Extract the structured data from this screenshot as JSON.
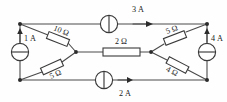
{
  "figure": {
    "name": "electrical-circuit-schematic",
    "type": "circuit-diagram",
    "width": 227,
    "height": 102,
    "background_color": "#fefefe",
    "line_color": "#4a4a4a"
  },
  "current_sources": [
    {
      "id": "source-top",
      "label": "3 A",
      "value": 3,
      "unit": "A",
      "orientation": "horizontal",
      "arrow_direction": "right",
      "symbol": "current-source-circle"
    },
    {
      "id": "source-bottom",
      "label": "2 A",
      "value": 2,
      "unit": "A",
      "orientation": "horizontal",
      "arrow_direction": "right",
      "symbol": "current-source-circle"
    },
    {
      "id": "source-left",
      "label": "1 A",
      "value": 1,
      "unit": "A",
      "orientation": "vertical",
      "arrow_direction": "up",
      "symbol": "current-source-circle"
    },
    {
      "id": "source-right",
      "label": "4 A",
      "value": 4,
      "unit": "A",
      "orientation": "vertical",
      "arrow_direction": "up",
      "symbol": "current-source-circle"
    }
  ],
  "resistors": [
    {
      "id": "resistor-upper-left",
      "label": "10 Ω",
      "value": 10,
      "unit": "Ω",
      "orientation": "diagonal-down-right"
    },
    {
      "id": "resistor-lower-left",
      "label": "5 Ω",
      "value": 5,
      "unit": "Ω",
      "orientation": "diagonal-up-right"
    },
    {
      "id": "resistor-center",
      "label": "2 Ω",
      "value": 2,
      "unit": "Ω",
      "orientation": "horizontal"
    },
    {
      "id": "resistor-upper-right",
      "label": "5 Ω",
      "value": 5,
      "unit": "Ω",
      "orientation": "diagonal-up-right"
    },
    {
      "id": "resistor-lower-right",
      "label": "4 Ω",
      "value": 4,
      "unit": "Ω",
      "orientation": "diagonal-down-right"
    }
  ],
  "nodes": [
    {
      "id": "node-top-left",
      "x": 20,
      "y": 24
    },
    {
      "id": "node-top-right",
      "x": 207,
      "y": 24
    },
    {
      "id": "node-bottom-left",
      "x": 20,
      "y": 80
    },
    {
      "id": "node-bottom-right",
      "x": 207,
      "y": 80
    },
    {
      "id": "node-center-left",
      "x": 76,
      "y": 52
    },
    {
      "id": "node-center-right",
      "x": 151,
      "y": 52
    }
  ]
}
